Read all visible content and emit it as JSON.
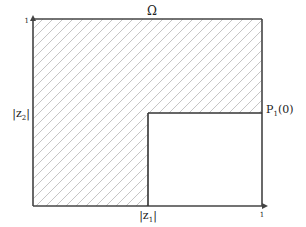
{
  "diagram": {
    "domain_label": "Ω",
    "region_description": "hatched region Ω in the unit square minus the lower-right rectangle",
    "labels": {
      "top": "Ω",
      "left_prefix": "|z",
      "left_sub": "2",
      "left_suffix": "|",
      "bottom_prefix": "|z",
      "bottom_sub": "1",
      "bottom_suffix": "|",
      "point_prefix": "P",
      "point_sub": "1",
      "point_suffix": "(0)"
    },
    "ticks": {
      "y_axis_max": "1",
      "x_axis_max": "1"
    },
    "geometry_data": {
      "x_range": [
        0,
        1
      ],
      "y_range": [
        0,
        1
      ],
      "corner_point": {
        "z1": 0.5,
        "z2": 0.5,
        "label": "P1(0)"
      }
    }
  }
}
